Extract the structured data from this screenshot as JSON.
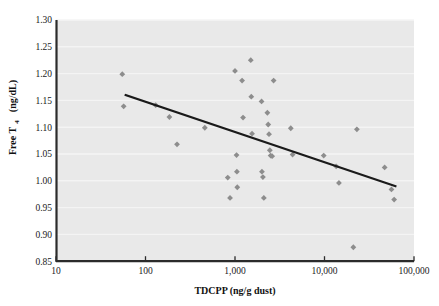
{
  "chart_data": {
    "type": "scatter",
    "title": "",
    "xlabel": "TDCPP (ng/g dust)",
    "ylabel": "Free T4 (ng/dL)",
    "ylabel_main": "Free T",
    "ylabel_subscript": "4",
    "ylabel_units": " (ng/dL)",
    "xscale": "log",
    "yscale": "linear",
    "xlim": [
      10,
      100000
    ],
    "ylim": [
      0.85,
      1.3
    ],
    "grid": "horizontal-white-faint",
    "legend": "none",
    "plot_background_color": "#e9e9e9",
    "marker_color": "#8d8d8d",
    "marker_shape": "diamond",
    "trendline_color": "#1a1a1a",
    "axis_color": "#2b2b2b",
    "xticks": [
      10,
      100,
      1000,
      10000,
      100000
    ],
    "xtick_labels": [
      "10",
      "100",
      "1,000",
      "10,000",
      "100,000"
    ],
    "yticks": [
      0.85,
      0.9,
      0.95,
      1.0,
      1.05,
      1.1,
      1.15,
      1.2,
      1.25,
      1.3
    ],
    "ytick_labels": [
      "0.85",
      "0.90",
      "0.95",
      "1.00",
      "1.05",
      "1.10",
      "1.15",
      "1.20",
      "1.25",
      "1.30"
    ],
    "points": [
      {
        "x": 55,
        "y": 1.199
      },
      {
        "x": 57,
        "y": 1.139
      },
      {
        "x": 130,
        "y": 1.141
      },
      {
        "x": 185,
        "y": 1.119
      },
      {
        "x": 225,
        "y": 1.068
      },
      {
        "x": 460,
        "y": 1.099
      },
      {
        "x": 830,
        "y": 1.006
      },
      {
        "x": 880,
        "y": 0.968
      },
      {
        "x": 1000,
        "y": 1.205
      },
      {
        "x": 1040,
        "y": 1.048
      },
      {
        "x": 1050,
        "y": 1.017
      },
      {
        "x": 1060,
        "y": 0.988
      },
      {
        "x": 1200,
        "y": 1.187
      },
      {
        "x": 1230,
        "y": 1.118
      },
      {
        "x": 1500,
        "y": 1.225
      },
      {
        "x": 1520,
        "y": 1.157
      },
      {
        "x": 1550,
        "y": 1.088
      },
      {
        "x": 1980,
        "y": 1.148
      },
      {
        "x": 2000,
        "y": 1.017
      },
      {
        "x": 2050,
        "y": 1.007
      },
      {
        "x": 2100,
        "y": 0.968
      },
      {
        "x": 2300,
        "y": 1.127
      },
      {
        "x": 2350,
        "y": 1.105
      },
      {
        "x": 2400,
        "y": 1.087
      },
      {
        "x": 2450,
        "y": 1.057
      },
      {
        "x": 2500,
        "y": 1.047
      },
      {
        "x": 2600,
        "y": 1.046
      },
      {
        "x": 2700,
        "y": 1.187
      },
      {
        "x": 4200,
        "y": 1.098
      },
      {
        "x": 4400,
        "y": 1.049
      },
      {
        "x": 9800,
        "y": 1.047
      },
      {
        "x": 13500,
        "y": 1.027
      },
      {
        "x": 14500,
        "y": 0.996
      },
      {
        "x": 21000,
        "y": 0.876
      },
      {
        "x": 23000,
        "y": 1.096
      },
      {
        "x": 47000,
        "y": 1.025
      },
      {
        "x": 56000,
        "y": 0.984
      },
      {
        "x": 60000,
        "y": 0.965
      }
    ],
    "trendline": {
      "x_start": 60,
      "y_start": 1.16,
      "x_end": 62000,
      "y_end": 0.99
    }
  }
}
